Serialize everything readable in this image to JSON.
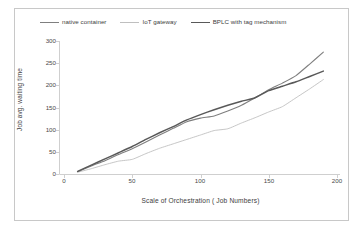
{
  "chart_data": {
    "type": "line",
    "title": "",
    "xlabel": "Scale of Orchestration ( Job Numbers)",
    "ylabel": "Job avg. waiting time",
    "xlim": [
      0,
      200
    ],
    "ylim": [
      0,
      300
    ],
    "xticks": [
      0,
      50,
      100,
      150,
      200
    ],
    "yticks": [
      0,
      50,
      100,
      150,
      200,
      250,
      300
    ],
    "grid": false,
    "legend_position": "top",
    "x": [
      10,
      20,
      30,
      40,
      50,
      60,
      70,
      80,
      90,
      100,
      110,
      120,
      130,
      140,
      150,
      160,
      170,
      180,
      190
    ],
    "series": [
      {
        "name": "native container",
        "color": "#7f7f7f",
        "width": 1.1,
        "values": [
          5,
          18,
          30,
          44,
          57,
          72,
          88,
          103,
          118,
          126,
          131,
          142,
          155,
          172,
          190,
          205,
          222,
          248,
          275
        ]
      },
      {
        "name": "IoT gateway",
        "color": "#bfbfbf",
        "width": 0.9,
        "values": [
          4,
          12,
          21,
          29,
          33,
          46,
          58,
          68,
          78,
          88,
          98,
          102,
          115,
          127,
          140,
          152,
          172,
          192,
          213
        ]
      },
      {
        "name": "BPLC with tag mechanism",
        "color": "#595959",
        "width": 1.5,
        "values": [
          6,
          20,
          34,
          48,
          62,
          78,
          93,
          107,
          122,
          134,
          145,
          155,
          164,
          172,
          188,
          198,
          208,
          220,
          232
        ]
      }
    ]
  },
  "legend": {
    "items": [
      {
        "label": "native container"
      },
      {
        "label": "IoT gateway"
      },
      {
        "label": "BPLC with tag mechanism"
      }
    ]
  },
  "axes": {
    "y_title": "Job avg. waiting time",
    "x_title": "Scale of Orchestration ( Job Numbers)",
    "y_ticks": [
      "0",
      "50",
      "100",
      "150",
      "200",
      "250",
      "300"
    ],
    "x_ticks": [
      "0",
      "50",
      "100",
      "150",
      "200"
    ]
  },
  "colors": {
    "frame": "#c8c8c8",
    "axis": "#bdbdbd",
    "text": "#3d3d3d",
    "series_native_container": "#7f7f7f",
    "series_iot_gateway": "#bfbfbf",
    "series_bplc": "#595959"
  }
}
